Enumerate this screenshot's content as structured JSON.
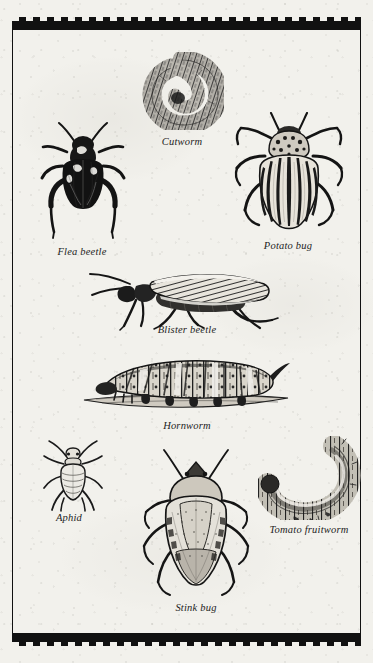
{
  "plate": {
    "title": "Tomato garden pests identification plate",
    "border_style": "castellated-checker",
    "paper_color": "#f2f1ec",
    "ink_color": "#151515"
  },
  "specimens": [
    {
      "id": "cutworm",
      "label": "Cutworm",
      "icon": "cutworm-illustration",
      "row": 1,
      "pose": "curled-coil"
    },
    {
      "id": "flea-beetle",
      "label": "Flea beetle",
      "icon": "flea-beetle-illustration",
      "row": 2,
      "pose": "dorsal-dark"
    },
    {
      "id": "potato-bug",
      "label": "Potato bug",
      "icon": "potato-bug-illustration",
      "row": 2,
      "pose": "dorsal-striped"
    },
    {
      "id": "blister-beetle",
      "label": "Blister beetle",
      "icon": "blister-beetle-illustration",
      "row": 3,
      "pose": "lateral"
    },
    {
      "id": "hornworm",
      "label": "Hornworm",
      "icon": "hornworm-illustration",
      "row": 4,
      "pose": "lateral-on-stem"
    },
    {
      "id": "aphid",
      "label": "Aphid",
      "icon": "aphid-illustration",
      "row": 5,
      "pose": "dorsal"
    },
    {
      "id": "stink-bug",
      "label": "Stink bug",
      "icon": "stink-bug-illustration",
      "row": 5,
      "pose": "dorsal-shield"
    },
    {
      "id": "tomato-fruitworm",
      "label": "Tomato fruitworm",
      "icon": "tomato-fruitworm-illustration",
      "row": 5,
      "pose": "c-curved"
    }
  ]
}
